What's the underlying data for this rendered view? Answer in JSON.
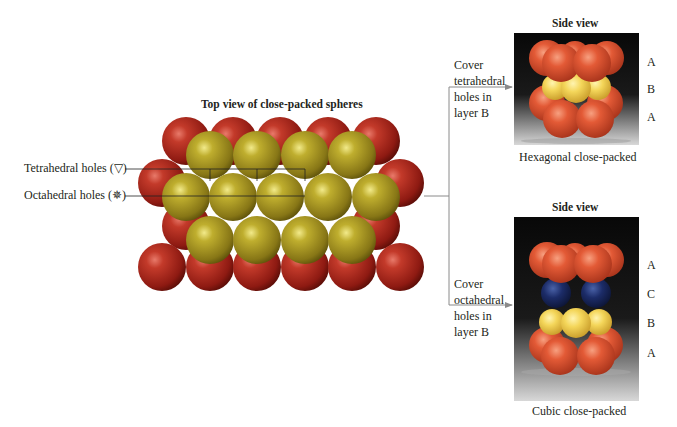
{
  "top_view": {
    "title": "Top view of close-packed spheres",
    "tetrahedral_label": "Tetrahedral holes (▽)",
    "octahedral_label": "Octahedral holes (✵)",
    "colors": {
      "layer_a": "#b52a1c",
      "layer_b": "#a99a1e"
    }
  },
  "hcp": {
    "heading": "Side view",
    "instruction": [
      "Cover",
      "tetrahedral",
      "holes in",
      "layer B"
    ],
    "layers": [
      "A",
      "B",
      "A"
    ],
    "caption": "Hexagonal close-packed",
    "colors": {
      "a": "#e05a3a",
      "b": "#f3d25a"
    }
  },
  "ccp": {
    "heading": "Side view",
    "instruction": [
      "Cover",
      "octahedral",
      "holes in",
      "layer B"
    ],
    "layers": [
      "A",
      "C",
      "B",
      "A"
    ],
    "caption": "Cubic close-packed",
    "colors": {
      "a": "#e05a3a",
      "b": "#f3d25a",
      "c": "#1e2f6e"
    }
  }
}
